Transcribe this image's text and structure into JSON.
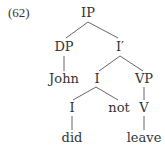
{
  "example_number": "(62)",
  "tree": {
    "nodes": {
      "ip": "IP",
      "dp": "DP",
      "ibar": "I′",
      "john": "John",
      "i_mid": "I",
      "vp": "VP",
      "i_low": "I",
      "not": "not",
      "v": "V",
      "did": "did",
      "leave": "leave"
    },
    "edges": [
      [
        "IP",
        "DP"
      ],
      [
        "IP",
        "I′"
      ],
      [
        "DP",
        "John"
      ],
      [
        "I′",
        "I"
      ],
      [
        "I′",
        "VP"
      ],
      [
        "I",
        "I"
      ],
      [
        "I",
        "not"
      ],
      [
        "VP",
        "V"
      ],
      [
        "I",
        "did"
      ],
      [
        "V",
        "leave"
      ]
    ]
  },
  "colors": {
    "text": "#333333",
    "lines": "#555555"
  }
}
